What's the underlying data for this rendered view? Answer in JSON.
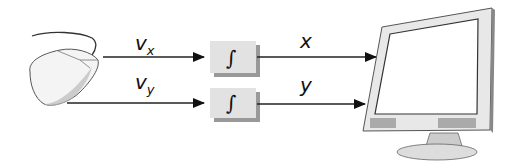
{
  "diagram": {
    "nodes": [
      {
        "id": "mouse",
        "type": "mouse-icon"
      },
      {
        "id": "integrator_x",
        "label": "∫"
      },
      {
        "id": "integrator_y",
        "label": "∫"
      },
      {
        "id": "monitor",
        "type": "monitor-icon"
      }
    ],
    "edges": [
      {
        "from": "mouse",
        "to": "integrator_x",
        "label": "v",
        "subscript": "x"
      },
      {
        "from": "mouse",
        "to": "integrator_y",
        "label": "v",
        "subscript": "y"
      },
      {
        "from": "integrator_x",
        "to": "monitor",
        "label": "x"
      },
      {
        "from": "integrator_y",
        "to": "monitor",
        "label": "y"
      }
    ]
  }
}
